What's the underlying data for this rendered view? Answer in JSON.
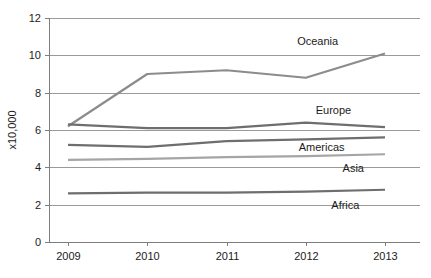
{
  "chart_data": {
    "type": "line",
    "title": "",
    "subtitle": "",
    "xlabel": "",
    "ylabel": "x10,000",
    "categories": [
      "2009",
      "2010",
      "2011",
      "2012",
      "2013"
    ],
    "x": [
      2009,
      2010,
      2011,
      2012,
      2013
    ],
    "xlim": [
      2009,
      2013
    ],
    "ylim": [
      0,
      12
    ],
    "yticks": [
      0,
      2,
      4,
      6,
      8,
      10,
      12
    ],
    "ytick_labels": [
      "0",
      "2",
      "4",
      "6",
      "8",
      "10",
      "12"
    ],
    "xtick_labels": [
      "2009",
      "2010",
      "2011",
      "2012",
      "2013"
    ],
    "grid": "horizontal",
    "legend_position": "inline-right-labels",
    "series": [
      {
        "name": "Oceania",
        "label": "Oceania",
        "color": "#8c8c8c",
        "values": [
          6.2,
          9.0,
          9.2,
          8.8,
          10.1
        ]
      },
      {
        "name": "Europe",
        "label": "Europe",
        "color": "#6e6e6e",
        "values": [
          6.3,
          6.1,
          6.1,
          6.4,
          6.15
        ]
      },
      {
        "name": "Americas",
        "label": "Americas",
        "color": "#6e6e6e",
        "values": [
          5.2,
          5.1,
          5.4,
          5.5,
          5.6
        ]
      },
      {
        "name": "Asia",
        "label": "Asia",
        "color": "#a5a5a5",
        "values": [
          4.4,
          4.45,
          4.55,
          4.6,
          4.7
        ]
      },
      {
        "name": "Africa",
        "label": "Africa",
        "color": "#6e6e6e",
        "values": [
          2.6,
          2.65,
          2.65,
          2.7,
          2.8
        ]
      }
    ],
    "annotations": [
      {
        "text": "Oceania",
        "x": 2012.15,
        "y": 10.75
      },
      {
        "text": "Europe",
        "x": 2012.35,
        "y": 7.05
      },
      {
        "text": "Americas",
        "x": 2012.2,
        "y": 5.1
      },
      {
        "text": "Asia",
        "x": 2012.6,
        "y": 3.95
      },
      {
        "text": "Africa",
        "x": 2012.5,
        "y": 2.0
      }
    ],
    "colors": {
      "gridline": "#9a9a9a",
      "axis": "#7d7d7d",
      "text": "#1b1b1b",
      "background": "#ffffff"
    }
  }
}
